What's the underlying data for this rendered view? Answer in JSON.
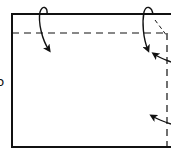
{
  "diagram": {
    "type": "origami-fold-instructions",
    "side_label": "b",
    "colors": {
      "stroke": "#111111",
      "background": "#ffffff"
    },
    "elements": [
      {
        "kind": "paper-outline",
        "description": "rectangular sheet"
      },
      {
        "kind": "valley-fold-line",
        "orientation": "horizontal",
        "description": "top fold line"
      },
      {
        "kind": "valley-fold-line",
        "orientation": "vertical",
        "description": "right fold line"
      },
      {
        "kind": "fold-arrow",
        "description": "fold top edge down (left)"
      },
      {
        "kind": "fold-arrow",
        "description": "fold top edge down (right)"
      },
      {
        "kind": "fold-arrow",
        "description": "fold right edge in (upper)"
      },
      {
        "kind": "fold-arrow",
        "description": "fold right edge in (lower)"
      },
      {
        "kind": "diagonal-crease",
        "description": "corner crease line"
      }
    ]
  }
}
